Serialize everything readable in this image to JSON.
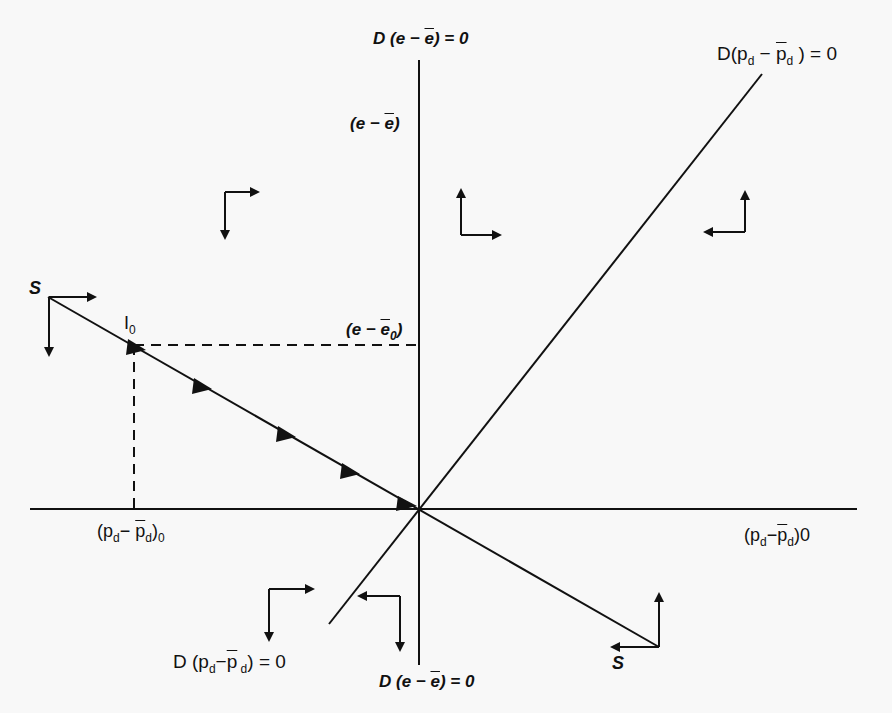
{
  "diagram": {
    "type": "phase-diagram",
    "axes": {
      "vertical_top_label": "D (e − e̅) = 0",
      "vertical_bottom_label": "D (e − e̅) = 0",
      "vertical_axis_label": "(e − e̅)",
      "horizontal_right_label": "(p",
      "horizontal_left_label": "(p"
    },
    "labels": {
      "top_D_prefix": "D (e − ",
      "top_D_ebar": "e",
      "top_D_suffix": ") = 0",
      "vaxis_prefix": "(e − ",
      "vaxis_ebar": "e",
      "vaxis_suffix": ")",
      "e0_prefix": "(e − ",
      "e0_ebar": "e",
      "e0_sub": "0",
      "e0_suffix": ")",
      "I0_main": "I",
      "I0_sub": "0",
      "S_top": "S",
      "S_bottom": "S",
      "pd_line_top_prefix": "D(p",
      "pd_line_top_sub1": "d",
      "pd_line_top_mid": " − ",
      "pd_line_top_pbar": "p",
      "pd_line_top_sub2": "d",
      "pd_line_top_suffix": " )  =  0",
      "pd0_left_prefix": "(p",
      "pd0_left_sub1": "d",
      "pd0_left_mid": "− ",
      "pd0_left_pbar": "p",
      "pd0_left_sub2": "d",
      "pd0_left_close": ")",
      "pd0_left_sub0": "0",
      "pd0_right_prefix": "(p",
      "pd0_right_sub1": "d",
      "pd0_right_mid": "−",
      "pd0_right_pbar": "p",
      "pd0_right_sub2": "d",
      "pd0_right_suffix": ")0",
      "pd_line_bottom_prefix": "D (p",
      "pd_line_bottom_sub1": "d",
      "pd_line_bottom_mid": "−",
      "pd_line_bottom_pbar": "p",
      "pd_line_bottom_sub2": " d",
      "pd_line_bottom_suffix": ") = 0",
      "bottom_D_prefix": "D (e − ",
      "bottom_D_ebar": "e",
      "bottom_D_suffix": ") = 0"
    },
    "direction_arrows": [
      {
        "region": "upper-left",
        "horizontal": "right",
        "vertical": "down"
      },
      {
        "region": "upper-middle",
        "horizontal": "right",
        "vertical": "up"
      },
      {
        "region": "upper-right",
        "horizontal": "left",
        "vertical": "up"
      },
      {
        "region": "S-start",
        "horizontal": "right",
        "vertical": "down"
      },
      {
        "region": "lower-left",
        "horizontal": "right",
        "vertical": "down"
      },
      {
        "region": "lower-middle",
        "horizontal": "left",
        "vertical": "down"
      },
      {
        "region": "S-end",
        "horizontal": "left",
        "vertical": "up"
      }
    ],
    "saddle_path_arrowheads": 4,
    "colors": {
      "ink": "#111111",
      "paper": "#f8f8f8"
    }
  }
}
